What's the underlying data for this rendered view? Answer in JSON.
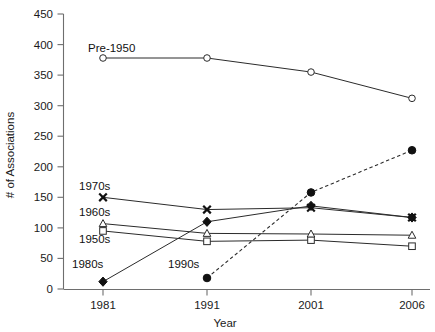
{
  "chart_data": {
    "type": "line",
    "title": "",
    "xlabel": "Year",
    "ylabel": "# of Associations",
    "categories": [
      "1981",
      "1991",
      "2001",
      "2006"
    ],
    "x": [
      1981,
      1991,
      2001,
      2006
    ],
    "xlim": [
      1981,
      2006
    ],
    "ylim": [
      0,
      450
    ],
    "ytick_step": 50,
    "yticks": [
      "0",
      "50",
      "100",
      "150",
      "200",
      "250",
      "300",
      "350",
      "400",
      "450"
    ],
    "ytick_values": [
      0,
      50,
      100,
      150,
      200,
      250,
      300,
      350,
      400,
      450
    ],
    "grid": false,
    "legend_position": "inline-annotations",
    "series": [
      {
        "name": "Pre-1950",
        "label": "Pre-1950",
        "marker": "open-circle",
        "linestyle": "solid",
        "values": [
          378,
          378,
          355,
          312
        ]
      },
      {
        "name": "1950s",
        "label": "1950s",
        "marker": "open-square",
        "linestyle": "solid",
        "values": [
          95,
          78,
          80,
          70
        ]
      },
      {
        "name": "1960s",
        "label": "1960s",
        "marker": "open-triangle",
        "linestyle": "solid",
        "values": [
          107,
          91,
          90,
          88
        ]
      },
      {
        "name": "1970s",
        "label": "1970s",
        "marker": "cross-x",
        "linestyle": "solid",
        "values": [
          150,
          130,
          133,
          117
        ]
      },
      {
        "name": "1980s",
        "label": "1980s",
        "marker": "filled-diamond",
        "linestyle": "solid",
        "values": [
          12,
          110,
          136,
          117
        ]
      },
      {
        "name": "1990s",
        "label": "1990s",
        "marker": "filled-circle",
        "linestyle": "dashed",
        "values": [
          null,
          18,
          158,
          227
        ]
      }
    ],
    "annotations": [
      {
        "text": "Pre-1950",
        "x_px": 88,
        "y_px": 52
      },
      {
        "text": "1970s",
        "x_px": 79,
        "y_px": 190
      },
      {
        "text": "1960s",
        "x_px": 79,
        "y_px": 216
      },
      {
        "text": "1950s",
        "x_px": 79,
        "y_px": 243
      },
      {
        "text": "1980s",
        "x_px": 72,
        "y_px": 268
      },
      {
        "text": "1990s",
        "x_px": 168,
        "y_px": 268
      }
    ]
  }
}
